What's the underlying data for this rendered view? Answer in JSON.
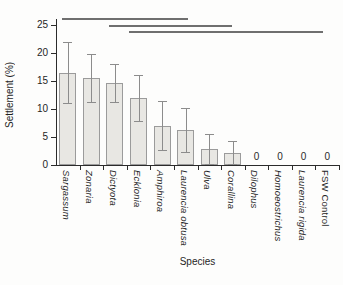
{
  "chart_data": {
    "type": "bar",
    "title": "",
    "xlabel": "Species",
    "ylabel": "Settlement (%)",
    "ylim": [
      0,
      25
    ],
    "yticks": [
      0,
      5,
      10,
      15,
      20,
      25
    ],
    "grid": false,
    "legend": "none",
    "categories": [
      "Sargassum",
      "Zonaria",
      "Dictyota",
      "Ecklonia",
      "Amphiroa",
      "Laurencia obtusa",
      "Ulva",
      "Corallina",
      "Dilophus",
      "Homoeostrichus",
      "Laurencia rigida",
      "FSW Control"
    ],
    "values": [
      16.5,
      15.5,
      14.7,
      11.9,
      7.0,
      6.2,
      2.8,
      2.2,
      0,
      0,
      0,
      0
    ],
    "errors": [
      5.4,
      4.3,
      3.4,
      4.1,
      4.4,
      3.9,
      2.8,
      2.1,
      0,
      0,
      0,
      0
    ],
    "italic_flags": [
      true,
      true,
      true,
      true,
      true,
      true,
      true,
      true,
      true,
      true,
      true,
      false
    ],
    "zero_label": "0",
    "significance_lines": [
      {
        "x_start_frac": 0.021,
        "x_end_frac": 0.466,
        "y_px": 18
      },
      {
        "x_start_frac": 0.187,
        "x_end_frac": 0.622,
        "y_px": 25
      },
      {
        "x_start_frac": 0.258,
        "x_end_frac": 0.943,
        "y_px": 31
      }
    ],
    "colors": {
      "bar_fill": "#e8e7e3",
      "bar_border": "#9b9b9b",
      "error_bar": "#8c8c8c",
      "significance_line": "#6f6f6f",
      "axis": "#2b2b2b",
      "text": "#1f1f1f",
      "background": "#fdfdfc"
    }
  }
}
